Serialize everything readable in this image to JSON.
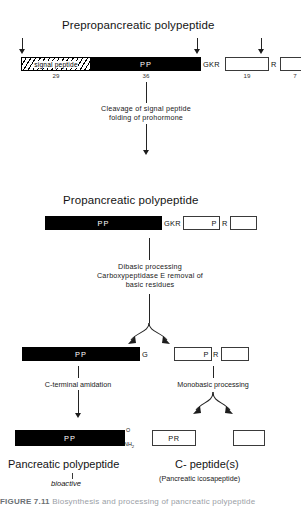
{
  "figure": {
    "stages": [
      {
        "name": "preprohormone",
        "heading": "Preprohormone",
        "heading_text": "Preprohormone"
      }
    ]
  },
  "row1": {
    "title": "Preprohormone",
    "title_text": "Preprohormone",
    "heading": "Preprohormone",
    "label": "Preprohormone",
    "title_full": "Prepropancreatic  polypeptide",
    "signal_peptide_label": "signal   peptide",
    "pp_label": "PP",
    "signal_count": "29",
    "pp_count": "36",
    "gkr_label": "GKR",
    "r_label": "R",
    "box19_count": "19",
    "box7_count": "7"
  },
  "step1": {
    "line1": "Cleavage  of  signal  peptide",
    "line2": "folding  of  prohormone"
  },
  "row2": {
    "title": "Propancreatic   polypeptide",
    "pp_label": "PP",
    "gkr_label": "GKR",
    "p_label": "P",
    "r_label": "R"
  },
  "step2": {
    "line1": "Dibasic  processing",
    "line2": "Carboxypeptidase  E  removal  of",
    "line3": "basic   residues"
  },
  "row3": {
    "pp_label": "PP",
    "g_label": "G",
    "p_label": "P",
    "r_label": "R"
  },
  "step3": {
    "left": "C-terminal   amidation",
    "right": "Monobasic   processing"
  },
  "row4": {
    "pp_label": "PP",
    "amide_o": "O",
    "amide_nh2": "NH",
    "amide_nh2_sub": "2",
    "pr_label": "PR"
  },
  "footer": {
    "left_title": "Pancreatic  polypeptide",
    "left_sub": "bioactive",
    "right_title": "C- peptide(s)",
    "right_sub": "(Pancreatic   icosapeptide)"
  },
  "caption": {
    "number": "FIGURE 7.11",
    "text": "Biosynthesis and processing of pancreatic polypeptide"
  },
  "colors": {
    "bar_fill": "#000000",
    "bar_text": "#ffffff",
    "box_border": "#3a3a3a",
    "line": "#242424",
    "page_bg": "#ffffff"
  }
}
